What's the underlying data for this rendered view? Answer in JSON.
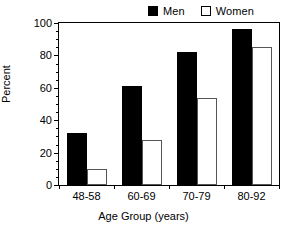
{
  "chart_data": {
    "type": "bar",
    "title": "",
    "xlabel": "Age Group (years)",
    "ylabel": "Percent",
    "categories": [
      "48-58",
      "60-69",
      "70-79",
      "80-92"
    ],
    "series": [
      {
        "name": "Men",
        "values": [
          32,
          61,
          82,
          96
        ],
        "color": "#000000",
        "fill": "solid"
      },
      {
        "name": "Women",
        "values": [
          10,
          28,
          54,
          85
        ],
        "color": "#ffffff",
        "fill": "open"
      }
    ],
    "ylim": [
      0,
      100
    ],
    "yticks": [
      0,
      20,
      40,
      60,
      80,
      100
    ],
    "ytick_labels": [
      "0",
      "20",
      "40",
      "60",
      "80",
      "100"
    ],
    "yminor_step": 5,
    "grid": false,
    "legend_position": "top-right",
    "legend_entries": [
      "Men",
      "Women"
    ]
  },
  "legend": {
    "men_label": "Men",
    "women_label": "Women"
  },
  "axes": {
    "y_title": "Percent",
    "x_title": "Age Group (years)"
  }
}
